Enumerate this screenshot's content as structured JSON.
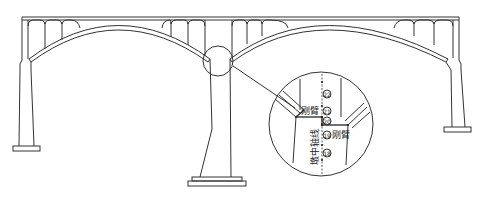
{
  "diagram": {
    "type": "arch-bridge-elevation",
    "spans": 2,
    "callout": {
      "segment_numbers": [
        "22",
        "21",
        "20",
        "19",
        "18"
      ],
      "rigid_arm_label": "刚臂",
      "pier_axis_label": "墩中轴线"
    },
    "colors": {
      "line": "#333333",
      "background": "#ffffff"
    }
  }
}
